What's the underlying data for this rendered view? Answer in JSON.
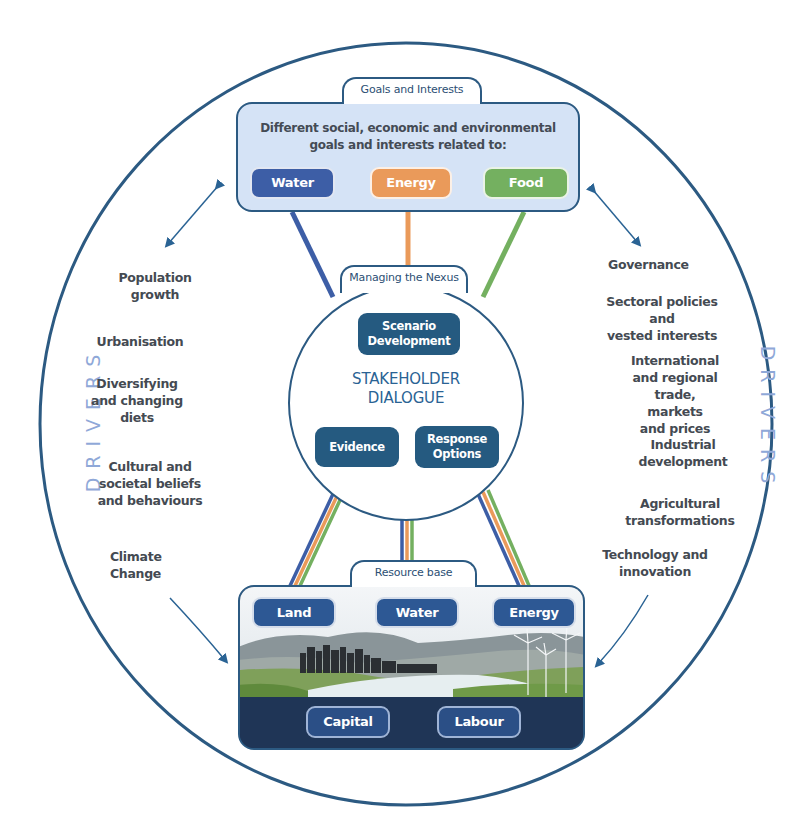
{
  "colors": {
    "outline": "#2c5a82",
    "water": "#3d5ea6",
    "energy": "#ea9a5a",
    "food": "#74b060",
    "dark_box": "#255a80",
    "goals_fill": "#d5e3f6",
    "drivers_label": "#8fa8d8",
    "resource_dark": "#1f3556"
  },
  "goals": {
    "tab_label": "Goals and Interests",
    "description_line1": "Different social, economic and environmental",
    "description_line2": "goals and interests related to:",
    "pills": [
      {
        "label": "Water",
        "color": "#3d5ea6"
      },
      {
        "label": "Energy",
        "color": "#ea9a5a"
      },
      {
        "label": "Food",
        "color": "#74b060"
      }
    ]
  },
  "nexus": {
    "tab_label": "Managing the Nexus",
    "scenario_line1": "Scenario",
    "scenario_line2": "Development",
    "title_line1": "STAKEHOLDER",
    "title_line2": "DIALOGUE",
    "evidence": "Evidence",
    "response_line1": "Response",
    "response_line2": "Options"
  },
  "resource": {
    "tab_label": "Resource base",
    "top_pills": [
      "Land",
      "Water",
      "Energy"
    ],
    "bottom_pills": [
      "Capital",
      "Labour"
    ]
  },
  "drivers": {
    "label": "DRIVERS",
    "left": [
      {
        "line1": "Population",
        "line2": "growth"
      },
      {
        "line1": "Urbanisation"
      },
      {
        "line1": "Diversifying",
        "line2": "and changing",
        "line3": "diets"
      },
      {
        "line1": "Cultural and",
        "line2": "societal beliefs",
        "line3": "and behaviours"
      },
      {
        "line1": "Climate",
        "line2": "Change"
      }
    ],
    "right": [
      {
        "line1": "Governance"
      },
      {
        "line1": "Sectoral policies and",
        "line2": "vested interests"
      },
      {
        "line1": "International",
        "line2": "and regional",
        "line3": "trade, markets",
        "line4": "and prices"
      },
      {
        "line1": "Industrial",
        "line2": "development"
      },
      {
        "line1": "Agricultural",
        "line2": "transformations"
      },
      {
        "line1": "Technology and",
        "line2": "innovation"
      }
    ]
  }
}
